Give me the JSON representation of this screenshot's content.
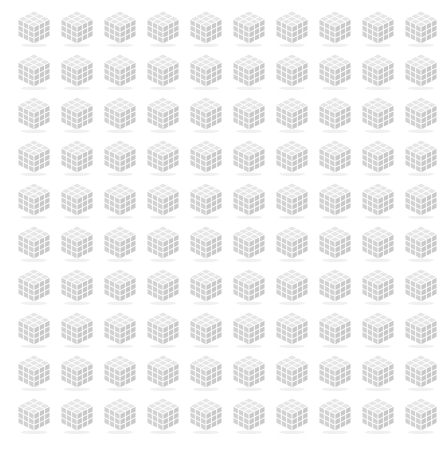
{
  "canvas": {
    "width": 445,
    "height": 451,
    "background_color": "#ffffff"
  },
  "grid": {
    "columns": 10,
    "rows": 10,
    "total_icons": 100,
    "origin_x": 14,
    "origin_y": 7,
    "column_pitch": 43,
    "row_pitch": 43
  },
  "icon": {
    "name": "cube-icon",
    "description": "isometric 3x3x3 cube",
    "subdivisions": 3,
    "width": 40,
    "height": 40,
    "colors": {
      "top_face": "#e6e6e6",
      "left_face": "#d2d2d2",
      "right_face": "#c9c9c9",
      "gap": "#ffffff",
      "shadow": "#f0f0f0"
    }
  }
}
